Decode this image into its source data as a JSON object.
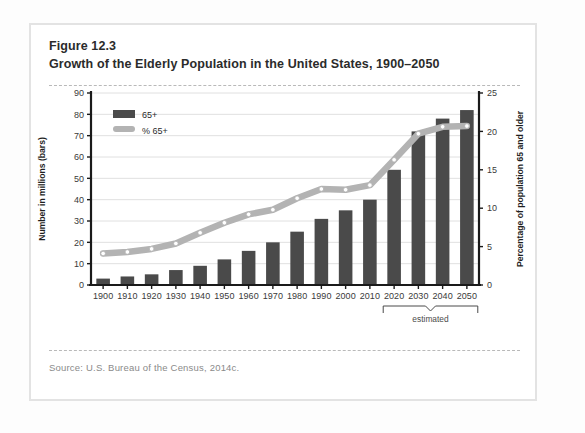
{
  "figure": {
    "number": "Figure 12.3",
    "title": "Growth of the Elderly Population in the United States, 1900–2050",
    "source": "Source: U.S. Bureau of the Census, 2014c."
  },
  "colors": {
    "bar": "#4a4a4a",
    "line": "#b3b3b3",
    "marker_fill": "#ffffff",
    "grid": "#dcdcdc",
    "axis": "#1a1a1a",
    "card_border": "#e3e3e3"
  },
  "annotations": {
    "estimated_label": "estimated",
    "estimated_from": "2020",
    "estimated_to": "2050"
  },
  "legend": {
    "position": "top-left",
    "items": [
      {
        "label": "65+",
        "marker": "bar-swatch"
      },
      {
        "label": "% 65+",
        "marker": "line-swatch"
      }
    ]
  },
  "chart_data": {
    "type": "bar",
    "title": "Growth of the Elderly Population in the United States, 1900–2050",
    "xlabel": "",
    "ylabel": "Number in millions (bars)",
    "y2label": "Percentage of population 65 and older",
    "ylim": [
      0,
      90
    ],
    "y2lim": [
      0,
      25
    ],
    "yticks": [
      0,
      10,
      20,
      30,
      40,
      50,
      60,
      70,
      80,
      90
    ],
    "y2ticks": [
      0,
      5,
      10,
      15,
      20,
      25
    ],
    "grid": true,
    "categories": [
      "1900",
      "1910",
      "1920",
      "1930",
      "1940",
      "1950",
      "1960",
      "1970",
      "1980",
      "1990",
      "2000",
      "2010",
      "2020",
      "2030",
      "2040",
      "2050"
    ],
    "series": [
      {
        "name": "65+",
        "type": "bar",
        "axis": "left",
        "unit": "millions",
        "values": [
          3,
          4,
          5,
          7,
          9,
          12,
          16,
          20,
          25,
          31,
          35,
          40,
          54,
          72,
          78,
          82
        ]
      },
      {
        "name": "% 65+",
        "type": "line",
        "axis": "right",
        "unit": "percent",
        "values": [
          4.1,
          4.3,
          4.7,
          5.4,
          6.8,
          8.1,
          9.2,
          9.8,
          11.3,
          12.5,
          12.4,
          13.0,
          16.3,
          19.7,
          20.6,
          20.7
        ]
      }
    ]
  }
}
